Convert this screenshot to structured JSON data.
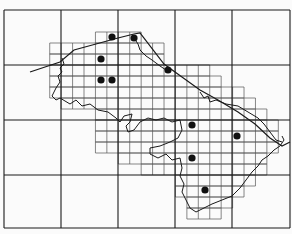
{
  "map": {
    "type": "grid-distribution-map",
    "background": "#fbfbfb",
    "ink": "#1a1a1a",
    "large_grid": {
      "x_lines": [
        4,
        61,
        118,
        175,
        232,
        290
      ],
      "y_lines": [
        10,
        65,
        120,
        175,
        228
      ]
    },
    "small_grid": {
      "origin_x": 4,
      "origin_y": 10,
      "cell_w": 11.43,
      "cell_h": 11.0,
      "rows": [
        {
          "row": 2,
          "x0": 96,
          "x1": 141
        },
        {
          "row": 3,
          "x0": 50,
          "x1": 164
        },
        {
          "row": 4,
          "x0": 50,
          "x1": 164
        },
        {
          "row": 5,
          "x0": 50,
          "x1": 210
        },
        {
          "row": 6,
          "x0": 50,
          "x1": 221
        },
        {
          "row": 7,
          "x0": 50,
          "x1": 244
        },
        {
          "row": 8,
          "x0": 61,
          "x1": 255
        },
        {
          "row": 9,
          "x0": 96,
          "x1": 266
        },
        {
          "row": 10,
          "x0": 96,
          "x1": 278
        },
        {
          "row": 11,
          "x0": 96,
          "x1": 278
        },
        {
          "row": 12,
          "x0": 96,
          "x1": 278
        },
        {
          "row": 13,
          "x0": 118,
          "x1": 266
        },
        {
          "row": 14,
          "x0": 141,
          "x1": 266
        },
        {
          "row": 15,
          "x0": 175,
          "x1": 255
        },
        {
          "row": 16,
          "x0": 175,
          "x1": 244
        },
        {
          "row": 17,
          "x0": 187,
          "x1": 232
        },
        {
          "row": 18,
          "x0": 187,
          "x1": 221
        }
      ]
    },
    "record_dots": [
      {
        "x": 112,
        "y": 37
      },
      {
        "x": 134,
        "y": 38
      },
      {
        "x": 101,
        "y": 59
      },
      {
        "x": 101,
        "y": 80
      },
      {
        "x": 112,
        "y": 80
      },
      {
        "x": 168,
        "y": 70
      },
      {
        "x": 192,
        "y": 125
      },
      {
        "x": 237,
        "y": 136
      },
      {
        "x": 192,
        "y": 158
      },
      {
        "x": 205,
        "y": 190
      }
    ],
    "dot_radius": 3.6,
    "coast_line": "M30,72 L60,62 L74,50 L96,44 L118,38 L134,34 L140,33 L164,64 L175,72 L200,90 L218,100 L238,112 L255,124 L270,138 L282,146 L290,142",
    "boundary_line": "M134,38 L138,44 L140,50 L146,56 L152,60 L160,66 L166,70 M62,58 L64,64 L60,68 L62,72 L58,76 L60,82 L56,88 L52,96 L56,100 L60,98 L70,104 L76,100 L82,106 L90,104 L98,110 L108,112 L116,118 L120,122 L124,116 L132,114 L130,122 L126,126 L128,132 L134,130 L140,122 L148,118 L156,120 L164,118 L172,122 L180,120 L182,130 L178,138 L170,142 L160,146 L150,148 L150,154 L158,158 L166,154 L172,160 L180,158 L182,168 L180,176 L184,184 L182,192 L186,200 L190,208 L196,212 L204,208 L212,204 L222,200 L232,196 L240,188 L246,180 L252,172 L258,166 L262,160 L268,156 L274,150 L280,146 L284,140 L282,136 M200,92 L204,98 L208,96 L210,102 L216,100 L226,104 L238,106 L248,112 L258,118 L264,124 L270,132 L276,140 L282,142"
  }
}
